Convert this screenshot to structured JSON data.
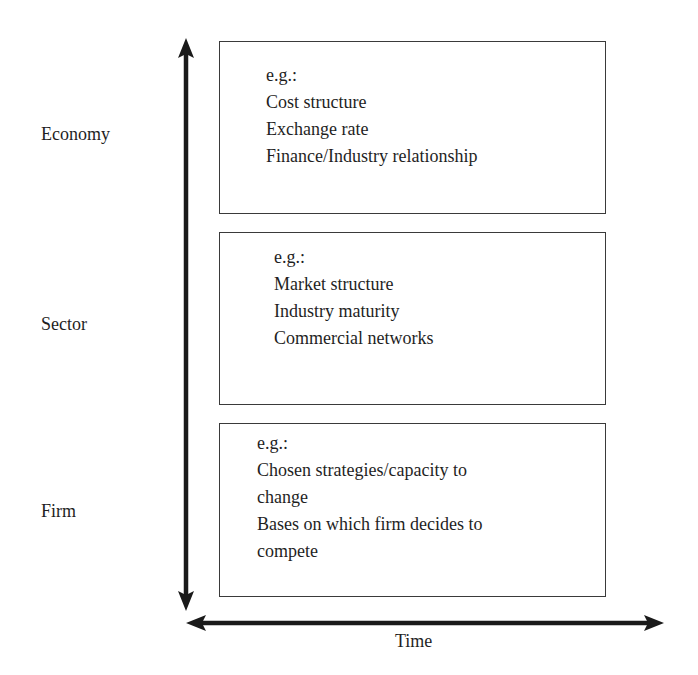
{
  "diagram": {
    "levels": [
      {
        "label": "Economy",
        "examples_heading": "e.g.:",
        "examples": [
          "Cost structure",
          "Exchange rate",
          "Finance/Industry relationship"
        ]
      },
      {
        "label": "Sector",
        "examples_heading": "e.g.:",
        "examples": [
          "Market structure",
          "Industry maturity",
          "Commercial networks"
        ]
      },
      {
        "label": "Firm",
        "examples_heading": "e.g.:",
        "examples": [
          "Chosen strategies/capacity to",
          "change",
          "Bases on which firm decides to",
          "compete"
        ]
      }
    ],
    "horizontal_axis_label": "Time",
    "vertical_axis": "bidirectional",
    "horizontal_axis": "bidirectional",
    "line_color": "#1a1a1a"
  }
}
